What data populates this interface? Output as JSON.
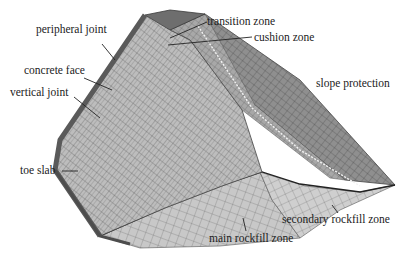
{
  "figure": {
    "labels": {
      "peripheral_joint": "peripheral joint",
      "concrete_face": "concrete face",
      "vertical_joint": "vertical joint",
      "toe_slab": "toe slab",
      "transition_zone": "transition zone",
      "cushion_zone": "cushion zone",
      "slope_protection": "slope protection",
      "secondary_rockfill_zone": "secondary rockfill zone",
      "main_rockfill_zone": "main rockfill zone"
    },
    "colors": {
      "face": "#b8b8b8",
      "face_dark": "#8a8a8a",
      "edge": "#555555",
      "crest": "#6e6e6e",
      "downstream": "#9c9c9c",
      "rockfill": "#c4c4c4",
      "mesh_line": "#4a4a4a"
    }
  }
}
